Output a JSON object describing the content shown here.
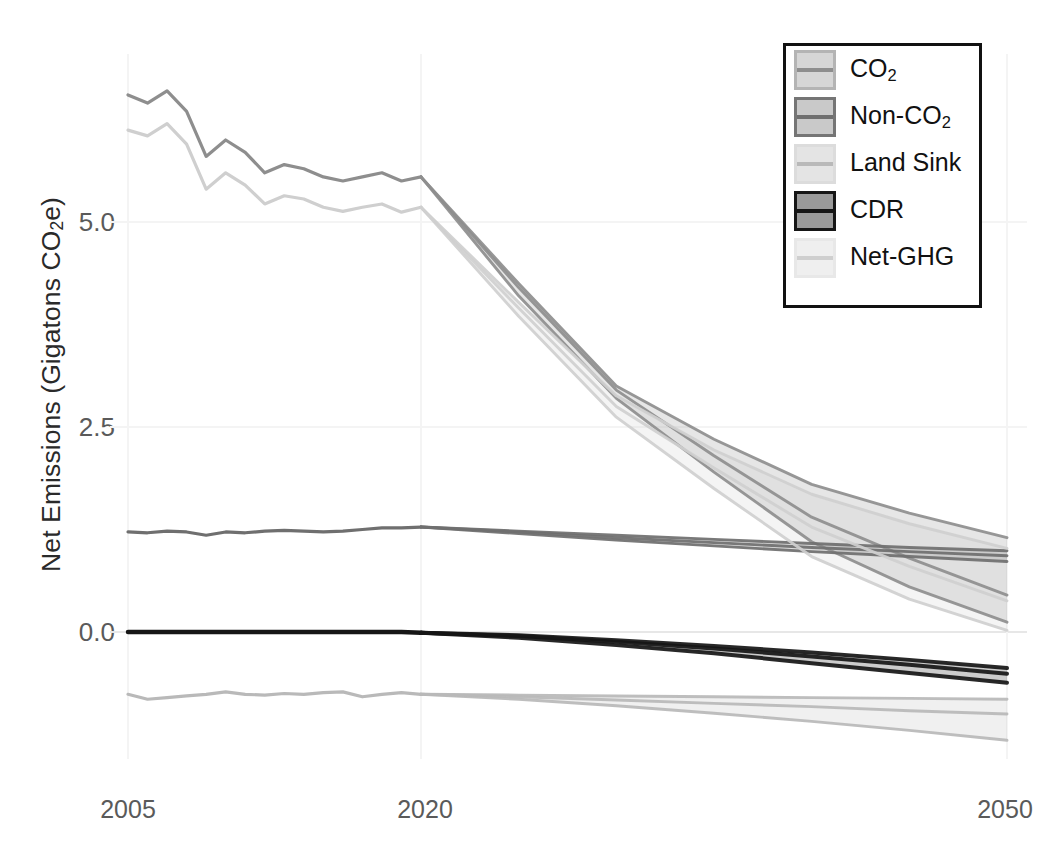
{
  "chart_data": {
    "type": "line",
    "title": "",
    "xlabel": "",
    "ylabel": "Net Emissions (Gigatons CO2e)",
    "ylabel_parts": {
      "pre": "Net Emissions (Gigatons CO",
      "sub": "2",
      "post": "e)"
    },
    "xlim": [
      2005,
      2050
    ],
    "ylim": [
      -1.55,
      7.05
    ],
    "xticks": [
      2005,
      2020,
      2050
    ],
    "xtick_labels": [
      "2005",
      "2020",
      "2050"
    ],
    "yticks": [
      0.0,
      2.5,
      5.0
    ],
    "ytick_labels": [
      "0.0",
      "2.5",
      "5.0"
    ],
    "grid": true,
    "grid_color": "#f4f4f4",
    "legend_position": "top-right",
    "legend_entries": [
      {
        "label": "CO2",
        "label_pre": "CO",
        "label_sub": "2",
        "label_post": "",
        "color": "#d6d6d6",
        "line_color": "#8e8e8e",
        "border": "#b4b4b4"
      },
      {
        "label": "Non-CO2",
        "label_pre": "Non-CO",
        "label_sub": "2",
        "label_post": "",
        "color": "#c9c9c9",
        "line_color": "#6f6f6f",
        "border": "#757575"
      },
      {
        "label": "Land Sink",
        "label_pre": "Land Sink",
        "label_sub": "",
        "label_post": "",
        "color": "#e4e4e4",
        "line_color": "#b9b9b9",
        "border": "#dcdcdc"
      },
      {
        "label": "CDR",
        "label_pre": "CDR",
        "label_sub": "",
        "label_post": "",
        "color": "#9a9a9a",
        "line_color": "#161616",
        "border": "#161616"
      },
      {
        "label": "Net-GHG",
        "label_pre": "Net-GHG",
        "label_sub": "",
        "label_post": "",
        "color": "#efefef",
        "line_color": "#cfcfcf",
        "border": "#e8e8e8"
      }
    ],
    "x_historical": [
      2005,
      2006,
      2007,
      2008,
      2009,
      2010,
      2011,
      2012,
      2013,
      2014,
      2015,
      2016,
      2017,
      2018,
      2019,
      2020
    ],
    "x_projection": [
      2020,
      2025,
      2030,
      2035,
      2040,
      2045,
      2050
    ],
    "series": [
      {
        "name": "CO2",
        "color": "#8e8e8e",
        "historical": [
          6.55,
          6.45,
          6.6,
          6.35,
          5.8,
          6.0,
          5.85,
          5.6,
          5.7,
          5.65,
          5.55,
          5.5,
          5.55,
          5.6,
          5.5,
          5.55
        ],
        "scenarios": [
          {
            "name": "scenario-low",
            "values": [
              5.55,
              4.1,
              2.85,
              1.95,
              1.1,
              0.55,
              0.12
            ]
          },
          {
            "name": "scenario-mid",
            "values": [
              5.55,
              4.2,
              2.95,
              2.15,
              1.4,
              0.9,
              0.45
            ]
          },
          {
            "name": "scenario-high",
            "values": [
              5.55,
              4.25,
              3.0,
              2.35,
              1.8,
              1.45,
              1.15
            ]
          }
        ]
      },
      {
        "name": "Non-CO2",
        "color": "#6f6f6f",
        "historical": [
          1.22,
          1.21,
          1.23,
          1.22,
          1.18,
          1.22,
          1.21,
          1.23,
          1.24,
          1.23,
          1.22,
          1.23,
          1.25,
          1.27,
          1.27,
          1.28
        ],
        "scenarios": [
          {
            "name": "scenario-low",
            "values": [
              1.28,
              1.2,
              1.12,
              1.05,
              0.98,
              0.92,
              0.86
            ]
          },
          {
            "name": "scenario-mid",
            "values": [
              1.28,
              1.22,
              1.15,
              1.09,
              1.03,
              0.98,
              0.93
            ]
          },
          {
            "name": "scenario-high",
            "values": [
              1.28,
              1.23,
              1.18,
              1.13,
              1.08,
              1.03,
              0.99
            ]
          }
        ]
      },
      {
        "name": "Land Sink",
        "color": "#b9b9b9",
        "historical": [
          -0.76,
          -0.82,
          -0.8,
          -0.78,
          -0.76,
          -0.73,
          -0.76,
          -0.77,
          -0.75,
          -0.76,
          -0.74,
          -0.73,
          -0.79,
          -0.76,
          -0.74,
          -0.76
        ],
        "scenarios": [
          {
            "name": "scenario-low",
            "values": [
              -0.76,
              -0.82,
              -0.9,
              -0.99,
              -1.09,
              -1.2,
              -1.32
            ]
          },
          {
            "name": "scenario-mid",
            "values": [
              -0.76,
              -0.79,
              -0.83,
              -0.87,
              -0.91,
              -0.96,
              -1.0
            ]
          },
          {
            "name": "scenario-high",
            "values": [
              -0.76,
              -0.77,
              -0.78,
              -0.79,
              -0.8,
              -0.81,
              -0.82
            ]
          }
        ]
      },
      {
        "name": "CDR",
        "color": "#161616",
        "historical": [
          0.0,
          0.0,
          0.0,
          0.0,
          0.0,
          0.0,
          0.0,
          0.0,
          0.0,
          0.0,
          0.0,
          0.0,
          0.0,
          0.0,
          0.0,
          -0.01
        ],
        "scenarios": [
          {
            "name": "scenario-low",
            "values": [
              -0.01,
              -0.07,
              -0.16,
              -0.26,
              -0.38,
              -0.5,
              -0.62
            ]
          },
          {
            "name": "scenario-mid",
            "values": [
              -0.01,
              -0.05,
              -0.12,
              -0.2,
              -0.3,
              -0.4,
              -0.51
            ]
          },
          {
            "name": "scenario-high",
            "values": [
              -0.01,
              -0.04,
              -0.1,
              -0.17,
              -0.25,
              -0.34,
              -0.44
            ]
          }
        ]
      },
      {
        "name": "Net-GHG",
        "color": "#cfcfcf",
        "historical": [
          6.12,
          6.05,
          6.2,
          5.95,
          5.4,
          5.6,
          5.45,
          5.22,
          5.32,
          5.28,
          5.18,
          5.13,
          5.18,
          5.22,
          5.12,
          5.18
        ],
        "scenarios": [
          {
            "name": "scenario-low",
            "values": [
              5.18,
              3.85,
              2.62,
              1.75,
              0.92,
              0.4,
              0.02
            ]
          },
          {
            "name": "scenario-mid",
            "values": [
              5.18,
              3.95,
              2.75,
              2.0,
              1.28,
              0.8,
              0.38
            ]
          },
          {
            "name": "scenario-high",
            "values": [
              5.18,
              4.02,
              2.88,
              2.22,
              1.68,
              1.32,
              1.02
            ]
          }
        ]
      }
    ]
  },
  "axis": {
    "y_title_pre": "Net Emissions (Gigatons CO",
    "y_title_sub": "2",
    "y_title_post": "e)",
    "ytick_0": "0.0",
    "ytick_1": "2.5",
    "ytick_2": "5.0",
    "xtick_0": "2005",
    "xtick_1": "2020",
    "xtick_2": "2050"
  },
  "legend": {
    "items": [
      {
        "pre": "CO",
        "sub": "2",
        "post": ""
      },
      {
        "pre": "Non-CO",
        "sub": "2",
        "post": ""
      },
      {
        "pre": "Land Sink",
        "sub": "",
        "post": ""
      },
      {
        "pre": "CDR",
        "sub": "",
        "post": ""
      },
      {
        "pre": "Net-GHG",
        "sub": "",
        "post": ""
      }
    ]
  }
}
